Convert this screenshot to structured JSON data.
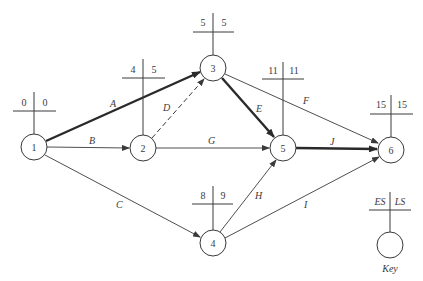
{
  "diagram": {
    "type": "activity-on-arrow network (CPM)",
    "colors": {
      "line": "#3a3a3a",
      "critical": "#2a2a2a",
      "background": "#ffffff"
    },
    "nodes": [
      {
        "id": "1",
        "label": "1",
        "es": "0",
        "ls": "0",
        "x": 34,
        "y": 147
      },
      {
        "id": "2",
        "label": "2",
        "es": "4",
        "ls": "5",
        "x": 143,
        "y": 148
      },
      {
        "id": "3",
        "label": "3",
        "es": "5",
        "ls": "5",
        "x": 213,
        "y": 68
      },
      {
        "id": "4",
        "label": "4",
        "es": "8",
        "ls": "9",
        "x": 213,
        "y": 243
      },
      {
        "id": "5",
        "label": "5",
        "es": "11",
        "ls": "11",
        "x": 283,
        "y": 148
      },
      {
        "id": "6",
        "label": "6",
        "es": "15",
        "ls": "15",
        "x": 391,
        "y": 150
      }
    ],
    "edges": [
      {
        "label": "A",
        "from": "1",
        "to": "3",
        "critical": true,
        "dashed": false
      },
      {
        "label": "B",
        "from": "1",
        "to": "2",
        "critical": false,
        "dashed": false
      },
      {
        "label": "C",
        "from": "1",
        "to": "4",
        "critical": false,
        "dashed": false
      },
      {
        "label": "D",
        "from": "2",
        "to": "3",
        "critical": false,
        "dashed": true
      },
      {
        "label": "E",
        "from": "3",
        "to": "5",
        "critical": true,
        "dashed": false
      },
      {
        "label": "F",
        "from": "3",
        "to": "6",
        "critical": false,
        "dashed": false
      },
      {
        "label": "G",
        "from": "2",
        "to": "5",
        "critical": false,
        "dashed": false
      },
      {
        "label": "H",
        "from": "4",
        "to": "5",
        "critical": false,
        "dashed": false
      },
      {
        "label": "I",
        "from": "4",
        "to": "6",
        "critical": false,
        "dashed": false
      },
      {
        "label": "J",
        "from": "5",
        "to": "6",
        "critical": true,
        "dashed": false
      }
    ],
    "key": {
      "es_label": "ES",
      "ls_label": "LS",
      "caption": "Key"
    }
  }
}
